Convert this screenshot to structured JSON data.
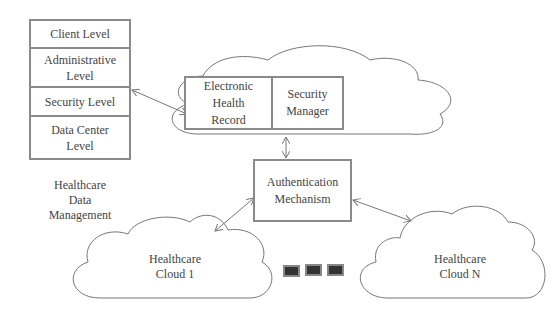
{
  "levels": [
    {
      "label": "Client Level"
    },
    {
      "label": "Administrative\nLevel"
    },
    {
      "label": "Security Level"
    },
    {
      "label": "Data Center\nLevel"
    }
  ],
  "caption": "Healthcare\nData\nManagement",
  "top_cloud": {
    "ehr": "Electronic\nHealth\nRecord",
    "security_manager": "Security\nManager"
  },
  "auth": "Authentication\nMechanism",
  "cloud1": "Healthcare\nCloud 1",
  "cloudN": "Healthcare\nCloud N",
  "colors": {
    "stroke": "#8a8a8a",
    "text": "#444444",
    "ellipsis": "#333333"
  }
}
